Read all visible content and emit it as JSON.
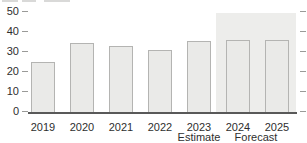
{
  "chart_data": {
    "type": "bar",
    "categories": [
      "2019",
      "2020",
      "2021",
      "2022",
      "2023",
      "2024",
      "2025"
    ],
    "values": [
      25.5,
      35,
      33.5,
      31.5,
      36,
      36.5,
      36.5
    ],
    "title": "",
    "xlabel": "",
    "ylabel": "",
    "ylim": [
      0,
      50
    ],
    "yticks": [
      0,
      10,
      20,
      30,
      40,
      50
    ],
    "tick_marks": "both-sides",
    "grid": false,
    "legend": null,
    "annotations": {
      "estimate_label": "Estimate",
      "estimate_category": "2023",
      "forecast_label": "Forecast",
      "forecast_categories": [
        "2024",
        "2025"
      ]
    },
    "forecast_shade_region": {
      "from_category": "2024",
      "to_category": "2025",
      "color": "#ededeb"
    },
    "colors": {
      "bar_fill": "#eaeae8",
      "bar_border": "#b4b4b2",
      "axis_line": "#595959",
      "tick": "#9a9a98",
      "text": "#2e2e2e"
    }
  }
}
